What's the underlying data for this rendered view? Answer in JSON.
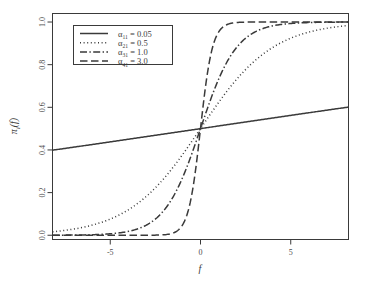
{
  "chart_data": {
    "type": "line",
    "title": "",
    "xlabel": "f",
    "ylabel": "πᵢ(f)",
    "xlim": [
      -8.2,
      8.2
    ],
    "ylim": [
      -0.02,
      1.04
    ],
    "xticks": [
      -5,
      0,
      5
    ],
    "xtick_labels": [
      "-5",
      "0",
      "5"
    ],
    "yticks": [
      0.0,
      0.2,
      0.4,
      0.6,
      0.8,
      1.0
    ],
    "ytick_labels": [
      "0.0",
      "0.2",
      "0.4",
      "0.6",
      "0.8",
      "1.0"
    ],
    "grid": false,
    "legend_position": "top-left",
    "function_form": "pi_i(f) = 1 / (1 + exp(-alpha * f))",
    "series": [
      {
        "name": "α₁₁ = 0.05",
        "alpha": 0.05,
        "linestyle": "solid",
        "color": "#3a3a3a",
        "x": [
          -8,
          -7,
          -6,
          -5,
          -4,
          -3,
          -2,
          -1,
          0,
          1,
          2,
          3,
          4,
          5,
          6,
          7,
          8
        ],
        "y": [
          0.401,
          0.414,
          0.426,
          0.438,
          0.45,
          0.463,
          0.475,
          0.488,
          0.5,
          0.512,
          0.525,
          0.537,
          0.55,
          0.562,
          0.574,
          0.586,
          0.599
        ]
      },
      {
        "name": "α₂₁ = 0.5",
        "alpha": 0.5,
        "linestyle": "dotted",
        "color": "#3a3a3a",
        "x": [
          -8,
          -7,
          -6,
          -5,
          -4,
          -3,
          -2,
          -1,
          0,
          1,
          2,
          3,
          4,
          5,
          6,
          7,
          8
        ],
        "y": [
          0.018,
          0.029,
          0.047,
          0.076,
          0.119,
          0.182,
          0.269,
          0.378,
          0.5,
          0.622,
          0.731,
          0.818,
          0.881,
          0.924,
          0.953,
          0.971,
          0.982
        ]
      },
      {
        "name": "α₃₁ = 1.0",
        "alpha": 1.0,
        "linestyle": "dashdot",
        "color": "#3a3a3a",
        "x": [
          -8,
          -7,
          -6,
          -5,
          -4,
          -3,
          -2,
          -1,
          0,
          1,
          2,
          3,
          4,
          5,
          6,
          7,
          8
        ],
        "y": [
          0.0,
          0.001,
          0.002,
          0.007,
          0.018,
          0.047,
          0.119,
          0.269,
          0.5,
          0.731,
          0.881,
          0.953,
          0.982,
          0.993,
          0.998,
          0.999,
          1.0
        ]
      },
      {
        "name": "α₄₁ = 3.0",
        "alpha": 3.0,
        "linestyle": "dashed",
        "color": "#3a3a3a",
        "x": [
          -8,
          -7,
          -6,
          -5,
          -4,
          -3,
          -2,
          -1,
          -0.5,
          0,
          0.5,
          1,
          2,
          3,
          4,
          5,
          6,
          7,
          8
        ],
        "y": [
          0.0,
          0.0,
          0.0,
          0.0,
          0.0,
          0.0,
          0.002,
          0.047,
          0.182,
          0.5,
          0.818,
          0.953,
          0.998,
          1.0,
          1.0,
          1.0,
          1.0,
          1.0,
          1.0
        ]
      }
    ]
  },
  "legend": {
    "entries": [
      {
        "symbol": "α",
        "subscript": "11",
        "equals": "=",
        "value": "0.05",
        "linestyle": "solid"
      },
      {
        "symbol": "α",
        "subscript": "21",
        "equals": "=",
        "value": "0.5",
        "linestyle": "dotted"
      },
      {
        "symbol": "α",
        "subscript": "31",
        "equals": "=",
        "value": "1.0",
        "linestyle": "dashdot"
      },
      {
        "symbol": "α",
        "subscript": "41",
        "equals": "=",
        "value": "3.0",
        "linestyle": "dashed"
      }
    ]
  },
  "axes": {
    "x_title": "f",
    "y_title_pi": "π",
    "y_title_sub": "i",
    "y_title_arg": "(f)"
  },
  "style": {
    "frame_color": "#3a3a3a",
    "line_color": "#3a3a3a",
    "text_color": "#4d4d4d",
    "background": "#ffffff"
  }
}
